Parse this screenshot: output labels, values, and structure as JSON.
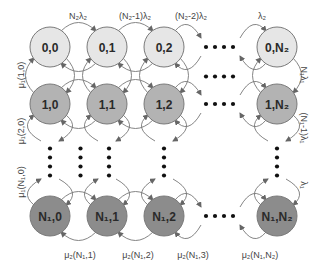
{
  "colors": {
    "row0_fill": "#e6e6e6",
    "row1_fill": "#b3b3b3",
    "rowN_fill": "#8c8c8c",
    "stroke": "#7a7a7a"
  },
  "nodes": [
    {
      "id": "0,0",
      "row": 0,
      "col": 0,
      "label": "0,0"
    },
    {
      "id": "0,1",
      "row": 0,
      "col": 1,
      "label": "0,1"
    },
    {
      "id": "0,2",
      "row": 0,
      "col": 2,
      "label": "0,2"
    },
    {
      "id": "0,N2",
      "row": 0,
      "col": 3,
      "label": "0,N₂"
    },
    {
      "id": "1,0",
      "row": 1,
      "col": 0,
      "label": "1,0"
    },
    {
      "id": "1,1",
      "row": 1,
      "col": 1,
      "label": "1,1"
    },
    {
      "id": "1,2",
      "row": 1,
      "col": 2,
      "label": "1,2"
    },
    {
      "id": "1,N2",
      "row": 1,
      "col": 3,
      "label": "1,N₂"
    },
    {
      "id": "N1,0",
      "row": 2,
      "col": 0,
      "label": "N₁,0"
    },
    {
      "id": "N1,1",
      "row": 2,
      "col": 1,
      "label": "N₁,1"
    },
    {
      "id": "N1,2",
      "row": 2,
      "col": 2,
      "label": "N₁,2"
    },
    {
      "id": "N1,N2",
      "row": 2,
      "col": 3,
      "label": "N₁,N₂"
    }
  ],
  "labels": {
    "top": [
      "N₂λ₂",
      "(N₂-1)λ₂",
      "(N₂-2)λ₂",
      "λ₂"
    ],
    "bottom": [
      "μ₂(N₁,1)",
      "μ₂(N₁,2)",
      "μ₂(N₁,3)",
      "μ₂(N₁,N₂)"
    ],
    "left": [
      "μ₁(1,0)",
      "μ₁(2,0)",
      "μ₁(N₁,0)"
    ],
    "right": [
      "N₁λ₁",
      "(N₁-1)λ₁",
      "λ₁"
    ]
  },
  "ellipsis": "••••"
}
